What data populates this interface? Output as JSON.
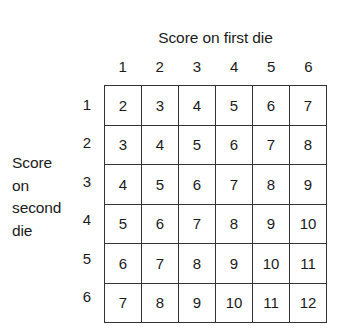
{
  "figure": {
    "column_axis_title": "Score on first die",
    "row_axis_title_lines": [
      "Score",
      "on",
      "second",
      "die"
    ],
    "row_axis_title_full": "Score on second die",
    "column_headers": [
      "1",
      "2",
      "3",
      "4",
      "5",
      "6"
    ],
    "row_headers": [
      "1",
      "2",
      "3",
      "4",
      "5",
      "6"
    ],
    "background_color": "#ffffff",
    "text_color": "#1b1b1b",
    "grid_line_color": "#333333",
    "grid_border_color": "#232323"
  },
  "chart_data": {
    "type": "table",
    "title": "",
    "xlabel": "Score on first die",
    "ylabel": "Score on second die",
    "categories": [
      "1",
      "2",
      "3",
      "4",
      "5",
      "6"
    ],
    "row_categories": [
      "1",
      "2",
      "3",
      "4",
      "5",
      "6"
    ],
    "grid": true,
    "legend": "none",
    "rows": [
      {
        "row_label": "1",
        "values": [
          "2",
          "3",
          "4",
          "5",
          "6",
          "7"
        ]
      },
      {
        "row_label": "2",
        "values": [
          "3",
          "4",
          "5",
          "6",
          "7",
          "8"
        ]
      },
      {
        "row_label": "3",
        "values": [
          "4",
          "5",
          "6",
          "7",
          "8",
          "9"
        ]
      },
      {
        "row_label": "4",
        "values": [
          "5",
          "6",
          "7",
          "8",
          "9",
          "10"
        ]
      },
      {
        "row_label": "5",
        "values": [
          "6",
          "7",
          "8",
          "9",
          "10",
          "11"
        ]
      },
      {
        "row_label": "6",
        "values": [
          "7",
          "8",
          "9",
          "10",
          "11",
          "12"
        ]
      }
    ]
  }
}
